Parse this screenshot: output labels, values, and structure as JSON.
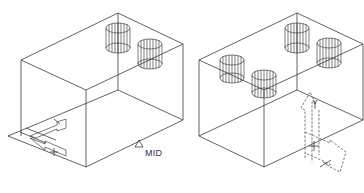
{
  "figure": {
    "views": [
      {
        "id": "left-view",
        "description": "Isometric wireframe box with two cylinders on top face; UCS icon at lower-left; midpoint osnap marker",
        "cylinders": 2,
        "snap_marker": {
          "symbol": "triangle",
          "label": "MID"
        },
        "ucs_icon": {
          "style": "solid",
          "position": "lower-left corner"
        }
      },
      {
        "id": "right-view",
        "description": "Isometric wireframe box with four cylinders on top face; UCS icon relocated to front-right face (dashed), Y axis label",
        "cylinders": 4,
        "ucs_icon": {
          "style": "dashed",
          "axis_label": "Y",
          "position": "front-right face"
        }
      }
    ],
    "colors": {
      "line": "#3a3a3a",
      "background": "#ffffff"
    }
  }
}
